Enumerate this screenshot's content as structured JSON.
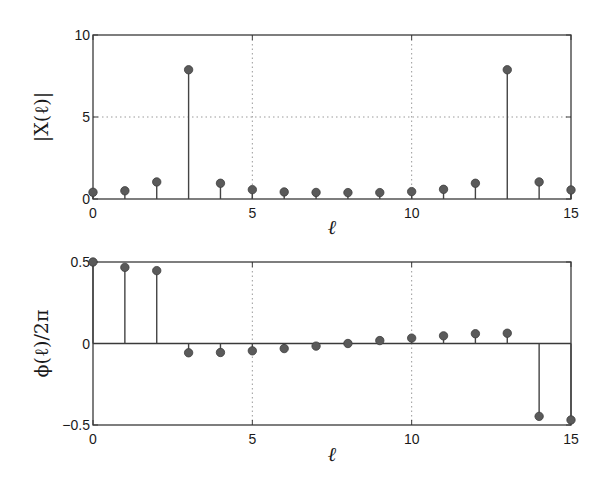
{
  "chart_data": [
    {
      "type": "stem",
      "title": "",
      "xlabel": "ℓ",
      "ylabel": "|X(ℓ)|",
      "x": [
        0,
        1,
        2,
        3,
        4,
        5,
        6,
        7,
        8,
        9,
        10,
        11,
        12,
        13,
        14,
        15
      ],
      "values": [
        0.41,
        0.5,
        1.04,
        7.88,
        0.96,
        0.57,
        0.43,
        0.4,
        0.39,
        0.39,
        0.45,
        0.59,
        0.96,
        7.88,
        1.04,
        0.55
      ],
      "xlim": [
        0,
        15
      ],
      "ylim": [
        0,
        10
      ],
      "xticks": [
        0,
        5,
        10,
        15
      ],
      "xtick_labels": [
        "0",
        "5",
        "10",
        "15"
      ],
      "yticks": [
        0,
        5,
        10
      ],
      "ytick_labels": [
        "0",
        "5",
        "10"
      ],
      "grid": true,
      "legend": null
    },
    {
      "type": "stem",
      "title": "",
      "xlabel": "ℓ",
      "ylabel": "ϕ(ℓ)/2π",
      "x": [
        0,
        1,
        2,
        3,
        4,
        5,
        6,
        7,
        8,
        9,
        10,
        11,
        12,
        13,
        14,
        15
      ],
      "values": [
        0.5,
        0.467,
        0.447,
        -0.057,
        -0.055,
        -0.045,
        -0.031,
        -0.016,
        0.0,
        0.018,
        0.033,
        0.047,
        0.06,
        0.063,
        -0.447,
        -0.469
      ],
      "xlim": [
        0,
        15
      ],
      "ylim": [
        -0.5,
        0.5
      ],
      "xticks": [
        0,
        5,
        10,
        15
      ],
      "xtick_labels": [
        "0",
        "5",
        "10",
        "15"
      ],
      "yticks": [
        -0.5,
        0,
        0.5
      ],
      "ytick_labels": [
        "−0.5",
        "0",
        "0.5"
      ],
      "grid": true,
      "legend": null
    }
  ],
  "style": {
    "axis_color": "#3a3a3a",
    "stem_color": "#444444",
    "marker_color": "#5a5a5a",
    "grid_color": "#9a9a9a"
  },
  "layout": {
    "plots": [
      {
        "left": 93,
        "top": 35,
        "right": 571,
        "bottom": 199,
        "xlabel_y": 234,
        "ylabel_x": 48
      },
      {
        "left": 93,
        "top": 262,
        "right": 571,
        "bottom": 425,
        "xlabel_y": 461,
        "ylabel_x": 48
      }
    ]
  },
  "labels": {
    "plot1": {
      "ylabel": "|X(ℓ)|",
      "xlabel": "ℓ"
    },
    "plot2": {
      "ylabel": "ϕ(ℓ)/2π",
      "xlabel": "ℓ"
    }
  }
}
